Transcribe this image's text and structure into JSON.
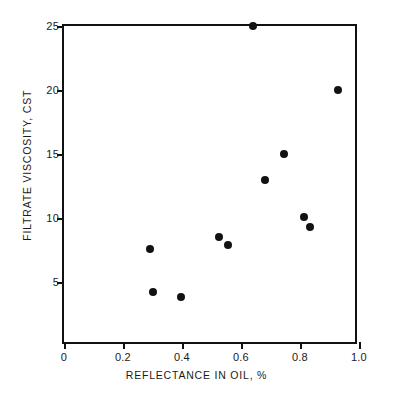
{
  "chart_data": {
    "type": "scatter",
    "title": "",
    "xlabel": "REFLECTANCE IN OIL, %",
    "ylabel": "FILTRATE VISCOSITY, CST",
    "xlim": [
      0,
      1.0
    ],
    "ylim": [
      0,
      25
    ],
    "xticks": [
      0,
      0.2,
      0.4,
      0.6,
      0.8,
      1.0
    ],
    "xtick_labels": [
      "0",
      "0.2",
      "0.4",
      "0.6",
      "0.8",
      "1.0"
    ],
    "yticks": [
      5,
      10,
      15,
      20,
      25
    ],
    "ytick_labels": [
      "5",
      "10",
      "15",
      "20",
      "25"
    ],
    "grid": false,
    "legend": "none",
    "marker": "filled-circle",
    "marker_color": "#121212",
    "axis_color": "#111111",
    "background_color": "#ffffff",
    "points": [
      {
        "x": 0.29,
        "y": 7.6
      },
      {
        "x": 0.3,
        "y": 4.2
      },
      {
        "x": 0.395,
        "y": 3.8
      },
      {
        "x": 0.525,
        "y": 8.5
      },
      {
        "x": 0.555,
        "y": 7.9
      },
      {
        "x": 0.64,
        "y": 25.0
      },
      {
        "x": 0.68,
        "y": 13.0
      },
      {
        "x": 0.745,
        "y": 15.0
      },
      {
        "x": 0.815,
        "y": 10.1
      },
      {
        "x": 0.835,
        "y": 9.3
      },
      {
        "x": 0.93,
        "y": 20.0
      }
    ]
  }
}
